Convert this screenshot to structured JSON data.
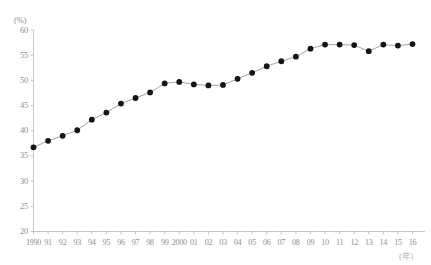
{
  "chart_data": {
    "type": "line",
    "title": "",
    "xlabel": "(年)",
    "ylabel": "(%)",
    "ylim": [
      20,
      60
    ],
    "ytick_step": 5,
    "yticks": [
      60,
      55,
      50,
      45,
      40,
      35,
      30,
      25,
      20
    ],
    "grid": false,
    "legend_position": "none",
    "marker": "filled-circle",
    "marker_color": "#151515",
    "line_color": "#9a9a9a",
    "axis_color": "#b9b9b9",
    "categories": [
      "1990",
      "91",
      "92",
      "93",
      "94",
      "95",
      "96",
      "97",
      "98",
      "99",
      "2000",
      "01",
      "02",
      "03",
      "04",
      "05",
      "06",
      "07",
      "08",
      "09",
      "10",
      "11",
      "12",
      "13",
      "14",
      "15",
      "16"
    ],
    "x": [
      1990,
      1991,
      1992,
      1993,
      1994,
      1995,
      1996,
      1997,
      1998,
      1999,
      2000,
      2001,
      2002,
      2003,
      2004,
      2005,
      2006,
      2007,
      2008,
      2009,
      2010,
      2011,
      2012,
      2013,
      2014,
      2015,
      2016
    ],
    "values": [
      36.7,
      38.0,
      39.0,
      40.1,
      42.2,
      43.6,
      45.4,
      46.5,
      47.6,
      49.4,
      49.7,
      49.2,
      49.0,
      49.1,
      50.3,
      51.5,
      52.8,
      53.8,
      54.7,
      56.3,
      57.1,
      57.1,
      57.0,
      55.8,
      57.1,
      56.9,
      57.2
    ],
    "point_labels": []
  },
  "axes": {
    "y_unit": "(%)",
    "x_unit": "(年)"
  }
}
